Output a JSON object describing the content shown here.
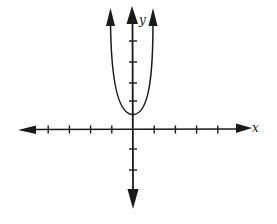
{
  "chart_data": {
    "type": "line",
    "title": "",
    "xlabel": "x",
    "ylabel": "y",
    "function_description": "Upward-opening narrow parabola with vertex on the positive y-axis, slightly above the origin",
    "series": [
      {
        "name": "parabola",
        "shape": "parabola",
        "opens": "up",
        "vertex": [
          0,
          0.75
        ],
        "arrows_on_ends": true,
        "points_approx": [
          [
            -1,
            6
          ],
          [
            -0.5,
            2
          ],
          [
            0,
            0.75
          ],
          [
            0.5,
            2
          ],
          [
            1,
            6
          ]
        ]
      }
    ],
    "x_ticks": [
      -4,
      -3,
      -2,
      -1,
      1,
      2,
      3,
      4
    ],
    "y_ticks": [
      -2,
      -1,
      1,
      2,
      3,
      4
    ],
    "tick_labels_shown": false,
    "xlim": [
      -5.5,
      5.5
    ],
    "ylim": [
      -3.9,
      6.2
    ],
    "grid": false,
    "axes_arrows": true
  },
  "labels": {
    "x_axis": "x",
    "y_axis": "y"
  },
  "colors": {
    "ink": "#1a1a1a",
    "background": "#ffffff"
  }
}
